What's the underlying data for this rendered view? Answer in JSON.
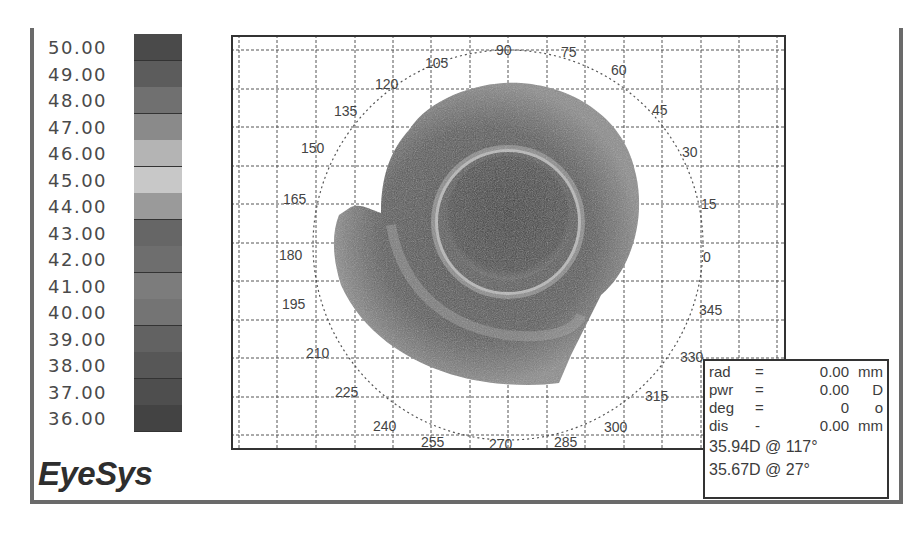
{
  "brand": {
    "name": "EyeSys"
  },
  "legend": {
    "title": "",
    "unit": "D",
    "items": [
      {
        "label": "50.00",
        "color": "#4a4a4a"
      },
      {
        "label": "49.00",
        "color": "#5c5c5c"
      },
      {
        "label": "48.00",
        "color": "#707070"
      },
      {
        "label": "47.00",
        "color": "#8a8a8a"
      },
      {
        "label": "46.00",
        "color": "#b4b4b4"
      },
      {
        "label": "45.00",
        "color": "#c8c8c8"
      },
      {
        "label": "44.00",
        "color": "#9a9a9a"
      },
      {
        "label": "43.00",
        "color": "#666666"
      },
      {
        "label": "42.00",
        "color": "#6e6e6e"
      },
      {
        "label": "41.00",
        "color": "#7c7c7c"
      },
      {
        "label": "40.00",
        "color": "#747474"
      },
      {
        "label": "39.00",
        "color": "#626262"
      },
      {
        "label": "38.00",
        "color": "#575757"
      },
      {
        "label": "37.00",
        "color": "#4e4e4e"
      },
      {
        "label": "36.00",
        "color": "#434343"
      }
    ]
  },
  "map": {
    "angle_labels": [
      {
        "text": "90"
      },
      {
        "text": "75"
      },
      {
        "text": "60"
      },
      {
        "text": "45"
      },
      {
        "text": "30"
      },
      {
        "text": "15"
      },
      {
        "text": "0"
      },
      {
        "text": "345"
      },
      {
        "text": "330"
      },
      {
        "text": "315"
      },
      {
        "text": "300"
      },
      {
        "text": "285"
      },
      {
        "text": "270"
      },
      {
        "text": "255"
      },
      {
        "text": "240"
      },
      {
        "text": "225"
      },
      {
        "text": "210"
      },
      {
        "text": "195"
      },
      {
        "text": "180"
      },
      {
        "text": "165"
      },
      {
        "text": "150"
      },
      {
        "text": "135"
      },
      {
        "text": "120"
      },
      {
        "text": "105"
      }
    ]
  },
  "readout": {
    "rows": [
      {
        "key": "rad",
        "eq": "=",
        "value": "0.00",
        "unit": "mm"
      },
      {
        "key": "pwr",
        "eq": "=",
        "value": "0.00",
        "unit": "D"
      },
      {
        "key": "deg",
        "eq": "=",
        "value": "0",
        "unit": "o"
      },
      {
        "key": "dis",
        "eq": "-",
        "value": "0.00",
        "unit": "mm"
      }
    ],
    "readings": [
      {
        "text": "35.94D @ 117°"
      },
      {
        "text": "35.67D @ 27°"
      }
    ]
  }
}
